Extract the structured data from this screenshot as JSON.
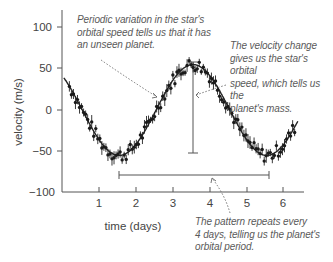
{
  "chart_data": {
    "type": "scatter",
    "title": "",
    "xlabel": "time (days)",
    "ylabel": "velocity (m/s)",
    "xlim": [
      0,
      6.5
    ],
    "ylim": [
      -100,
      120
    ],
    "x_ticks": [
      1,
      2,
      3,
      4,
      5,
      6
    ],
    "y_ticks": [
      100,
      50,
      0,
      -50,
      -100
    ],
    "grid": false,
    "legend": null,
    "fit_curve": {
      "type": "sinusoid",
      "amplitude": 55,
      "period_days": 4,
      "phase_peak_day": 3.55,
      "offset": 0,
      "x": [
        0.05,
        0.5,
        1.0,
        1.55,
        2.0,
        2.5,
        3.0,
        3.55,
        4.0,
        4.5,
        5.0,
        5.55,
        6.0,
        6.4
      ],
      "y": [
        37,
        8,
        -30,
        -55,
        -45,
        -5,
        33,
        56,
        42,
        10,
        -30,
        -55,
        -42,
        -14
      ]
    },
    "annotations": [
      {
        "text": "Periodic variation in the star's orbital speed tells us that it has an unseen planet.",
        "points_to": [
          2.65,
          15
        ]
      },
      {
        "text": "The velocity change gives us the star's orbital speed, which tells us the planet's mass.",
        "points_to": [
          3.55,
          5
        ]
      },
      {
        "text": "The pattern repeats every 4 days, telling us the planet's orbital period.",
        "points_to": [
          4.0,
          -80
        ]
      }
    ],
    "amplitude_bar": {
      "x": 3.55,
      "y_from": 57,
      "y_to": -53
    },
    "period_bar": {
      "y": -80,
      "x_from": 1.55,
      "x_to": 5.6
    }
  },
  "axes": {
    "x_label": "time (days)",
    "y_label": "velocity (m/s)",
    "x_ticks": [
      "1",
      "2",
      "3",
      "4",
      "5",
      "6"
    ],
    "y_ticks": [
      "100",
      "50",
      "0",
      "−50",
      "−100"
    ]
  },
  "notes": {
    "periodic": [
      "Periodic variation in the star's",
      "orbital speed tells us that it has",
      "an unseen planet."
    ],
    "velocity": [
      "The velocity change",
      "gives us the star's orbital",
      "speed, which tells us the",
      "planet's mass."
    ],
    "pattern": [
      "The pattern repeats every",
      "4 days, telling us the planet's",
      "orbital period."
    ]
  }
}
